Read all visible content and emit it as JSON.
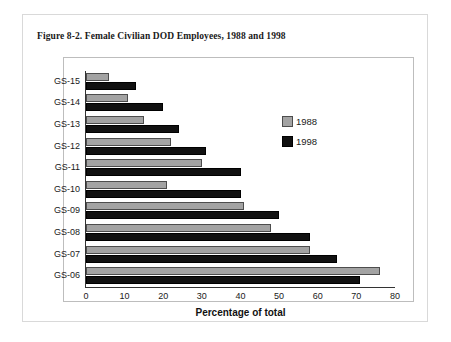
{
  "figure": {
    "title": "Figure 8-2. Female Civilian DOD Employees, 1988 and 1998"
  },
  "chart_data": {
    "type": "bar",
    "orientation": "horizontal",
    "title": "Figure 8-2. Female Civilian DOD Employees, 1988 and 1998",
    "xlabel": "Percentage of total",
    "ylabel": "",
    "xlim": [
      0,
      80
    ],
    "xticks": [
      0,
      10,
      20,
      30,
      40,
      50,
      60,
      70,
      80
    ],
    "xtick_labels": [
      "0",
      "10",
      "20",
      "30",
      "40",
      "50",
      "60",
      "70",
      "80"
    ],
    "grid": false,
    "legend_position": "upper right inside plot",
    "categories": [
      "GS-15",
      "GS-14",
      "GS-13",
      "GS-12",
      "GS-11",
      "GS-10",
      "GS-09",
      "GS-08",
      "GS-07",
      "GS-06"
    ],
    "series": [
      {
        "name": "1988",
        "color": "#a3a3a3",
        "values": [
          6,
          11,
          15,
          22,
          30,
          21,
          41,
          48,
          58,
          76
        ]
      },
      {
        "name": "1998",
        "color": "#111111",
        "values": [
          13,
          20,
          24,
          31,
          40,
          40,
          50,
          58,
          65,
          71
        ]
      }
    ]
  }
}
